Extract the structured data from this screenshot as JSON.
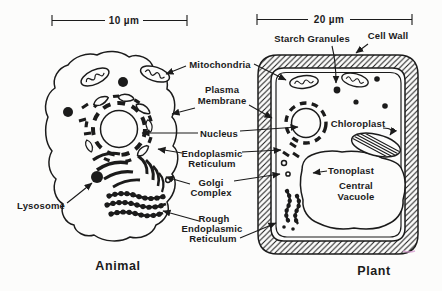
{
  "figure": {
    "animal_caption": "Animal",
    "plant_caption": "Plant",
    "animal_scale": "10 µm",
    "plant_scale": "20 µm"
  },
  "labels": {
    "starch_granules": "Starch Granules",
    "cell_wall": "Cell Wall",
    "mitochondria": "Mitochondria",
    "plasma_membrane": [
      "Plasma",
      "Membrane"
    ],
    "nucleus": "Nucleus",
    "endoplasmic_reticulum": [
      "Endoplasmic",
      "Reticulum"
    ],
    "golgi_complex": [
      "Golgi",
      "Complex"
    ],
    "chloroplast": "Chloroplast",
    "tonoplast": "Tonoplast",
    "central_vacuole": [
      "Central",
      "Vacuole"
    ],
    "rough_endoplasmic_reticulum": [
      "Rough",
      "Endoplasmic",
      "Reticulum"
    ],
    "lysosome": "Lysosome"
  },
  "colors": {
    "ink": "#1b1b1b",
    "paper": "#fcfcfb",
    "scan_artifact_pink": "#d9a3d4"
  }
}
